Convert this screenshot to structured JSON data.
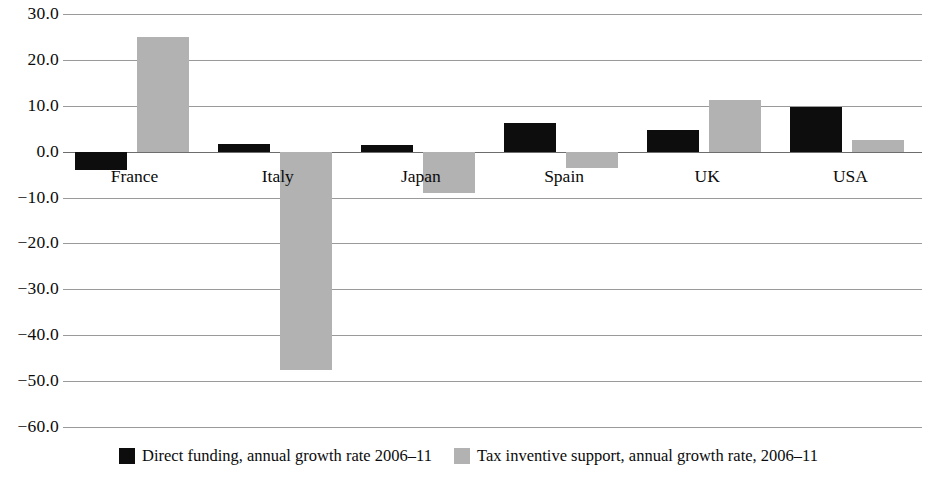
{
  "chart_data": {
    "type": "bar",
    "title": "",
    "subtitle": "",
    "xlabel": "",
    "ylabel": "",
    "categories": [
      "France",
      "Italy",
      "Japan",
      "Spain",
      "UK",
      "USA"
    ],
    "series": [
      {
        "name": "Direct funding, annual growth rate 2006–11",
        "key": "direct",
        "color": "#0d0d0d",
        "values": [
          -4.1,
          1.7,
          1.4,
          6.3,
          4.8,
          9.7
        ]
      },
      {
        "name": "Tax inventive support, annual growth rate, 2006–11",
        "key": "tax",
        "color": "#b2b2b2",
        "values": [
          25.0,
          -47.5,
          -9.0,
          -3.5,
          11.2,
          2.5
        ]
      }
    ],
    "ylim": [
      -60.0,
      30.0
    ],
    "yticks": [
      30.0,
      20.0,
      10.0,
      0.0,
      -10.0,
      -20.0,
      -30.0,
      -40.0,
      -50.0,
      -60.0
    ],
    "ytick_labels": [
      "30.0",
      "20.0",
      "10.0",
      "0.0",
      "−10.0",
      "−20.0",
      "−30.0",
      "−40.0",
      "−50.0",
      "−60.0"
    ],
    "grid": true,
    "grid_color": "#9a9a9a",
    "legend_position": "bottom",
    "background": "#ffffff"
  },
  "legend": {
    "entries": [
      {
        "label": "Direct funding, annual growth rate 2006–11",
        "swatch": "direct-funding-swatch"
      },
      {
        "label": "Tax inventive support, annual growth rate, 2006–11",
        "swatch": "tax-incentive-swatch"
      }
    ]
  }
}
